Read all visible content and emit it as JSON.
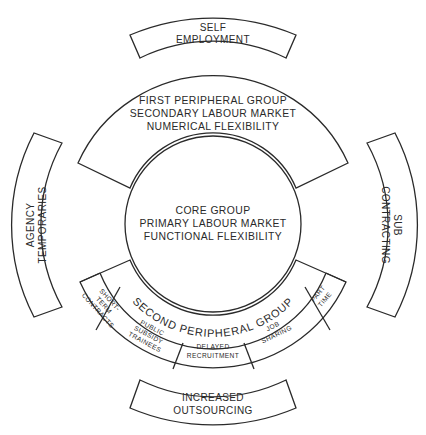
{
  "diagram": {
    "outer_segments": {
      "top": [
        "SELF",
        "EMPLOYMENT"
      ],
      "left": [
        "AGENCY",
        "TEMPORARIES"
      ],
      "right": [
        "SUB",
        "CONTRACTING"
      ],
      "bottom": [
        "INCREASED",
        "OUTSOURCING"
      ]
    },
    "first_peripheral": [
      "FIRST PERIPHERAL GROUP",
      "SECONDARY LABOUR MARKET",
      "NUMERICAL FLEXIBILITY"
    ],
    "core": [
      "CORE GROUP",
      "PRIMARY LABOUR MARKET",
      "FUNCTIONAL FLEXIBILITY"
    ],
    "second_peripheral": {
      "label": "SECOND PERIPHERAL GROUP",
      "segments": [
        {
          "lines": [
            "SHORT-",
            "TERM",
            "CONTRACTS"
          ]
        },
        {
          "lines": [
            "PUBLIC",
            "SUBSIDY",
            "TRAINEES"
          ]
        },
        {
          "lines": [
            "DELAYED",
            "RECRUITMENT"
          ]
        },
        {
          "lines": [
            "JOB",
            "SHARING"
          ]
        },
        {
          "lines": [
            "PART",
            "TIME"
          ]
        }
      ]
    }
  }
}
